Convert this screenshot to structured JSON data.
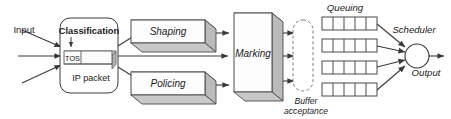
{
  "diagram": {
    "type": "flow-diagram",
    "colors": {
      "background": "#ffffff",
      "line": "#3a3a3a",
      "face": "#ffffff",
      "shade_top": "#d8d8d8",
      "shade_side": "#bdbdbd",
      "text": "#1a1a1a"
    },
    "labels": {
      "input": "Input",
      "classification": "Classification",
      "tos": "TOS",
      "ip_packet": "IP packet",
      "shaping": "Shaping",
      "policing": "Policing",
      "marking": "Marking",
      "buffer_line1": "Buffer",
      "buffer_line2": "acceptance",
      "queuing": "Queuing",
      "scheduler": "Scheduler",
      "output": "Output"
    },
    "structure": {
      "input_arrows": 3,
      "classification_outputs": 3,
      "marking_outputs": 3,
      "queue_count": 4,
      "cells_per_queue": 5,
      "scheduler_inputs": 4,
      "scheduler_outputs": 1
    },
    "icons": {
      "scheduler": "circle-node-icon",
      "buffer": "dashed-stadium-icon",
      "packet": "packet-3d-icon"
    }
  }
}
